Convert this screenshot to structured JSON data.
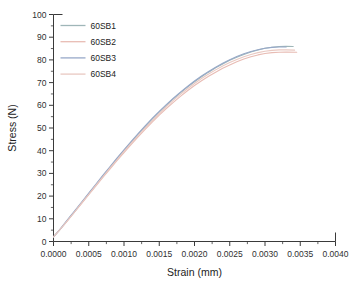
{
  "chart_data": {
    "type": "line",
    "title": "",
    "xlabel": "Strain (mm)",
    "ylabel": "Stress (N)",
    "xlim": [
      0.0,
      0.004
    ],
    "ylim": [
      0,
      100
    ],
    "xticks": [
      0.0,
      0.0005,
      0.001,
      0.0015,
      0.002,
      0.0025,
      0.003,
      0.0035,
      0.004
    ],
    "xticklabels": [
      "0.0000",
      "0.0005",
      "0.0010",
      "0.0015",
      "0.0020",
      "0.0025",
      "0.0030",
      "0.0035",
      "0.0040"
    ],
    "yticks": [
      0,
      10,
      20,
      30,
      40,
      50,
      60,
      70,
      80,
      90,
      100
    ],
    "yticklabels": [
      "0",
      "10",
      "20",
      "30",
      "40",
      "50",
      "60",
      "70",
      "80",
      "90",
      "100"
    ],
    "x_minor_per_major": 2,
    "y_minor_per_major": 2,
    "grid": false,
    "legend_position": "upper-left",
    "series": [
      {
        "name": "60SB1",
        "color": "#9fb6b8",
        "x": [
          0.0,
          0.0001,
          0.0002,
          0.0003,
          0.0004,
          0.0005,
          0.0006,
          0.0007,
          0.0008,
          0.0009,
          0.001,
          0.0011,
          0.0012,
          0.0013,
          0.0014,
          0.0015,
          0.0016,
          0.0017,
          0.0018,
          0.0019,
          0.002,
          0.0021,
          0.0022,
          0.0023,
          0.0024,
          0.0025,
          0.0026,
          0.0027,
          0.0028,
          0.0029,
          0.003,
          0.0031,
          0.0032,
          0.0033,
          0.0034
        ],
        "y": [
          2.0,
          5.6,
          9.4,
          13.2,
          17.1,
          21.0,
          24.9,
          28.8,
          32.6,
          36.4,
          40.1,
          43.7,
          47.2,
          50.6,
          53.9,
          57.0,
          60.0,
          62.8,
          65.5,
          68.0,
          70.4,
          72.6,
          74.6,
          76.5,
          78.2,
          79.8,
          81.2,
          82.4,
          83.5,
          84.4,
          85.1,
          85.6,
          85.9,
          86.0,
          85.9
        ]
      },
      {
        "name": "60SB2",
        "color": "#e8bcb4",
        "x": [
          0.0,
          0.0001,
          0.0002,
          0.0003,
          0.0004,
          0.0005,
          0.0006,
          0.0007,
          0.0008,
          0.0009,
          0.001,
          0.0011,
          0.0012,
          0.0013,
          0.0014,
          0.0015,
          0.0016,
          0.0017,
          0.0018,
          0.0019,
          0.002,
          0.0021,
          0.0022,
          0.0023,
          0.0024,
          0.0025,
          0.0026,
          0.0027,
          0.0028,
          0.0029,
          0.003,
          0.0031,
          0.0032,
          0.0033,
          0.00345
        ],
        "y": [
          2.0,
          5.5,
          9.2,
          13.0,
          16.8,
          20.6,
          24.4,
          28.2,
          31.9,
          35.6,
          39.2,
          42.7,
          46.1,
          49.4,
          52.6,
          55.7,
          58.6,
          61.3,
          63.9,
          66.4,
          68.7,
          70.8,
          72.8,
          74.6,
          76.3,
          77.8,
          79.2,
          80.4,
          81.4,
          82.2,
          82.8,
          83.2,
          83.4,
          83.5,
          83.4
        ]
      },
      {
        "name": "60SB3",
        "color": "#97a8c8",
        "x": [
          0.0,
          0.0001,
          0.0002,
          0.0003,
          0.0004,
          0.0005,
          0.0006,
          0.0007,
          0.0008,
          0.0009,
          0.001,
          0.0011,
          0.0012,
          0.0013,
          0.0014,
          0.0015,
          0.0016,
          0.0017,
          0.0018,
          0.0019,
          0.002,
          0.0021,
          0.0022,
          0.0023,
          0.0024,
          0.0025,
          0.0026,
          0.0027,
          0.0028,
          0.0029,
          0.003,
          0.0031,
          0.0032,
          0.0033
        ],
        "y": [
          2.0,
          5.7,
          9.6,
          13.5,
          17.4,
          21.3,
          25.2,
          29.1,
          32.9,
          36.7,
          40.4,
          44.0,
          47.5,
          50.9,
          54.2,
          57.3,
          60.3,
          63.1,
          65.8,
          68.3,
          70.7,
          72.9,
          74.9,
          76.8,
          78.5,
          80.1,
          81.5,
          82.7,
          83.7,
          84.5,
          85.1,
          85.5,
          85.7,
          85.7
        ]
      },
      {
        "name": "60SB4",
        "color": "#e9c9c2",
        "x": [
          0.0,
          0.0001,
          0.0002,
          0.0003,
          0.0004,
          0.0005,
          0.0006,
          0.0007,
          0.0008,
          0.0009,
          0.001,
          0.0011,
          0.0012,
          0.0013,
          0.0014,
          0.0015,
          0.0016,
          0.0017,
          0.0018,
          0.0019,
          0.002,
          0.0021,
          0.0022,
          0.0023,
          0.0024,
          0.0025,
          0.0026,
          0.0027,
          0.0028,
          0.0029,
          0.003,
          0.0031,
          0.0032,
          0.0033,
          0.00342
        ],
        "y": [
          2.0,
          5.6,
          9.3,
          13.1,
          17.0,
          20.8,
          24.7,
          28.5,
          32.3,
          36.0,
          39.7,
          43.2,
          46.7,
          50.1,
          53.3,
          56.4,
          59.4,
          62.2,
          64.8,
          67.3,
          69.6,
          71.8,
          73.8,
          75.6,
          77.3,
          78.8,
          80.2,
          81.4,
          82.4,
          83.2,
          83.8,
          84.2,
          84.4,
          84.4,
          84.3
        ]
      }
    ],
    "legend_entries": [
      {
        "label": "60SB1",
        "color": "#9fb6b8"
      },
      {
        "label": "60SB2",
        "color": "#e8bcb4"
      },
      {
        "label": "60SB3",
        "color": "#97a8c8"
      },
      {
        "label": "60SB4",
        "color": "#e9c9c2"
      }
    ]
  }
}
